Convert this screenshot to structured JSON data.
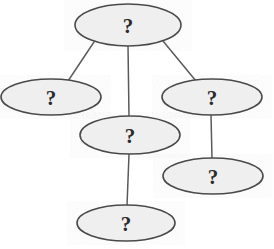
{
  "diagram": {
    "type": "tree-graph",
    "title": "",
    "canvas": {
      "width": 274,
      "height": 249,
      "background": "#ffffff"
    },
    "style": {
      "node_fill": "#efefef",
      "node_stroke": "#4a4a4a",
      "node_stroke_width": 1.6,
      "edge_stroke": "#5a5a5a",
      "edge_stroke_width": 1.5,
      "label_color": "#2b2b2b"
    },
    "nodes": [
      {
        "id": "n1",
        "label": "?",
        "cx": 128,
        "cy": 25,
        "rx": 53,
        "ry": 21,
        "name": "node-root"
      },
      {
        "id": "n2",
        "label": "?",
        "cx": 51,
        "cy": 97,
        "rx": 50,
        "ry": 18,
        "name": "node-left"
      },
      {
        "id": "n3",
        "label": "?",
        "cx": 212,
        "cy": 97,
        "rx": 50,
        "ry": 18,
        "name": "node-right"
      },
      {
        "id": "n4",
        "label": "?",
        "cx": 130,
        "cy": 135,
        "rx": 50,
        "ry": 19,
        "name": "node-middle"
      },
      {
        "id": "n5",
        "label": "?",
        "cx": 213,
        "cy": 176,
        "rx": 50,
        "ry": 18,
        "name": "node-lower-right"
      },
      {
        "id": "n6",
        "label": "?",
        "cx": 126,
        "cy": 223,
        "rx": 49,
        "ry": 18,
        "name": "node-bottom"
      }
    ],
    "edges": [
      {
        "id": "e1",
        "from": "n1",
        "to": "n2",
        "x1": 94,
        "y1": 42,
        "x2": 68,
        "y2": 81,
        "name": "edge-root-to-left"
      },
      {
        "id": "e2",
        "from": "n1",
        "to": "n3",
        "x1": 163,
        "y1": 41,
        "x2": 196,
        "y2": 81,
        "name": "edge-root-to-right"
      },
      {
        "id": "e3",
        "from": "n1",
        "to": "n4",
        "x1": 128,
        "y1": 45,
        "x2": 129,
        "y2": 117,
        "name": "edge-root-to-middle"
      },
      {
        "id": "e4",
        "from": "n4",
        "to": "n6",
        "x1": 129,
        "y1": 154,
        "x2": 127,
        "y2": 206,
        "name": "edge-middle-to-bottom"
      },
      {
        "id": "e5",
        "from": "n3",
        "to": "n5",
        "x1": 211,
        "y1": 114,
        "x2": 212,
        "y2": 159,
        "name": "edge-right-to-lower-right"
      }
    ]
  }
}
